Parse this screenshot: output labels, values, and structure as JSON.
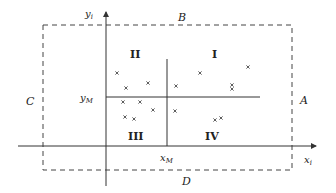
{
  "diagram": {
    "region_labels": {
      "top": "B",
      "right": "A",
      "left": "C",
      "bottom": "D"
    },
    "axes": {
      "x_label_base": "x",
      "x_label_sub": "i",
      "y_label_base": "y",
      "y_label_sub": "i"
    },
    "medians": {
      "x_label_base": "x",
      "x_label_sub": "M",
      "y_label_base": "y",
      "y_label_sub": "M"
    },
    "quadrants": {
      "q1": "I",
      "q2": "II",
      "q3": "III",
      "q4": "IV"
    },
    "points": [
      [
        117,
        73
      ],
      [
        126,
        88
      ],
      [
        148,
        83
      ],
      [
        123,
        102
      ],
      [
        140,
        102
      ],
      [
        125,
        117
      ],
      [
        134,
        119
      ],
      [
        153,
        110
      ],
      [
        176,
        86
      ],
      [
        200,
        73
      ],
      [
        232,
        85
      ],
      [
        232,
        89
      ],
      [
        248,
        67
      ],
      [
        175,
        111
      ],
      [
        215,
        120
      ],
      [
        221,
        118
      ]
    ],
    "colors": {
      "line": "#333333",
      "dash": "#444444",
      "point": "#333333"
    }
  }
}
